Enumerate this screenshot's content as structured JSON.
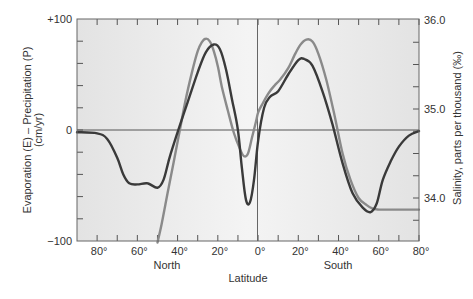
{
  "chart_data": {
    "type": "line",
    "title": "",
    "xlabel": "Latitude",
    "ylabel": "Evaporation (E) – Precipitation (P) (cm/yr)",
    "ylabel_left_line1": "Evaporation (E) – Precipitation (P)",
    "ylabel_left_line2": "(cm/yr)",
    "ylabel_right": "Salinity, parts per thousand (‰)",
    "hemisphere_labels": {
      "north": "North",
      "south": "South"
    },
    "xlim": [
      90,
      -80
    ],
    "x_note": "x values are latitude; positive = North, negative = South",
    "ylim": [
      -100,
      100
    ],
    "ylim_right": [
      33.5,
      36.0
    ],
    "x_ticks": [
      {
        "value": 80,
        "label": "80°"
      },
      {
        "value": 60,
        "label": "60°"
      },
      {
        "value": 40,
        "label": "40°"
      },
      {
        "value": 20,
        "label": "20°"
      },
      {
        "value": 0,
        "label": "0°"
      },
      {
        "value": -20,
        "label": "20°"
      },
      {
        "value": -40,
        "label": "40°"
      },
      {
        "value": -60,
        "label": "60°"
      },
      {
        "value": -80,
        "label": "80°"
      }
    ],
    "y_ticks_left": [
      {
        "value": 100,
        "label": "+100"
      },
      {
        "value": 0,
        "label": "0"
      },
      {
        "value": -100,
        "label": "−100"
      }
    ],
    "y_ticks_right": [
      {
        "value": 36.0,
        "label": "36.0"
      },
      {
        "value": 35.0,
        "label": "35.0"
      },
      {
        "value": 34.0,
        "label": "34.0"
      }
    ],
    "grid": false,
    "zero_line": true,
    "equator_line": true,
    "legend": null,
    "series": [
      {
        "name": "Evaporation – Precipitation",
        "axis": "left",
        "color": "#3a3a3a",
        "x": [
          90,
          80,
          75,
          70,
          67,
          64,
          60,
          55,
          50,
          47,
          44,
          40,
          35,
          30,
          26,
          22,
          19,
          16,
          13,
          10,
          8,
          6,
          4,
          2,
          0,
          -3,
          -6,
          -10,
          -15,
          -20,
          -23,
          -27,
          -32,
          -37,
          -42,
          -47,
          -52,
          -56,
          -59,
          -62,
          -66,
          -70,
          -75,
          -80
        ],
        "y": [
          -2,
          -3,
          -8,
          -25,
          -40,
          -48,
          -49,
          -48,
          -52,
          -45,
          -25,
          -2,
          25,
          52,
          70,
          77,
          73,
          55,
          28,
          0,
          -35,
          -63,
          -65,
          -45,
          -10,
          20,
          30,
          35,
          50,
          63,
          64,
          58,
          35,
          5,
          -30,
          -57,
          -70,
          -74,
          -66,
          -45,
          -28,
          -15,
          -5,
          -1
        ]
      },
      {
        "name": "Salinity",
        "axis": "right",
        "color": "#8a8a8a",
        "x": [
          50,
          48,
          45,
          42,
          39,
          36,
          33,
          30,
          28,
          26,
          24,
          22,
          20,
          18,
          15,
          12,
          9,
          7,
          5,
          3,
          1,
          0,
          -2,
          -5,
          -8,
          -11,
          -15,
          -18,
          -21,
          -24,
          -27,
          -30,
          -34,
          -38,
          -42,
          -46,
          -50,
          -54,
          -57,
          -60,
          -65,
          -70,
          -75,
          -80
        ],
        "y": [
          33.5,
          33.7,
          34.05,
          34.4,
          34.75,
          35.1,
          35.4,
          35.65,
          35.75,
          35.79,
          35.76,
          35.65,
          35.48,
          35.25,
          34.98,
          34.73,
          34.55,
          34.47,
          34.5,
          34.68,
          34.86,
          34.96,
          35.05,
          35.17,
          35.26,
          35.33,
          35.46,
          35.6,
          35.72,
          35.78,
          35.76,
          35.62,
          35.32,
          34.93,
          34.5,
          34.2,
          34.0,
          33.92,
          33.88,
          33.87,
          33.87,
          33.87,
          33.87,
          33.87
        ]
      }
    ]
  },
  "plot_style": {
    "background_outer": "#e9e9e9",
    "background_center": "#f5f5f5",
    "frame_color": "#555555",
    "zero_line_color": "#555555"
  }
}
